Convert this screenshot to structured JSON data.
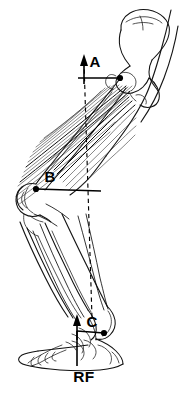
{
  "figure": {
    "background_color": "#ffffff",
    "ink_color": "#000000",
    "width": 180,
    "height": 396
  },
  "labels": {
    "hip_joint": "A",
    "stifle_joint": "B",
    "hock_joint": "C",
    "reaction_force": "RF"
  },
  "annotations": {
    "vertical_reference_line_style": "dashed",
    "force_vector_style": "solid arrow pointing up",
    "moment_arm_style": "solid horizontal bar"
  },
  "anatomy": {
    "parts": [
      "ilium",
      "ischium",
      "femur",
      "patella",
      "tibia",
      "fibula",
      "tarsus",
      "metatarsus",
      "phalanges",
      "calcaneus",
      "gluteal-muscle",
      "hamstring-muscle",
      "gastrocnemius-muscle",
      "digital-flexor-tendon"
    ]
  }
}
